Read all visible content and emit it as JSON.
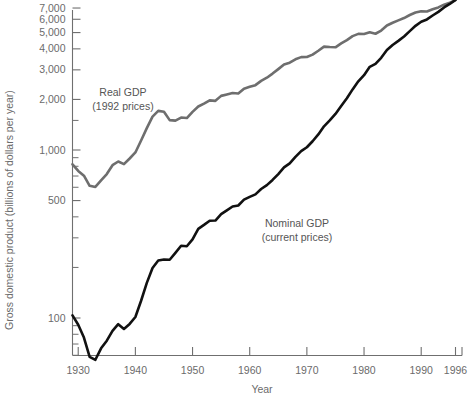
{
  "chart_data": {
    "type": "line",
    "title": "",
    "xlabel": "Year",
    "ylabel": "Gross domestic product (billions of dollars per year)",
    "yscale": "log",
    "ylim": [
      40,
      8000
    ],
    "xlim": [
      1929,
      1996
    ],
    "grid": false,
    "legend": "inline-annotations",
    "y_tick_labels": [
      "100",
      "500",
      "1,000",
      "2,000",
      "3,000",
      "4,000",
      "5,000",
      "6,000",
      "7,000"
    ],
    "y_tick_values": [
      100,
      500,
      1000,
      2000,
      3000,
      4000,
      5000,
      6000,
      7000
    ],
    "y_minor_ticks": [
      50,
      60,
      70,
      80,
      90,
      200,
      300,
      400,
      600,
      700,
      800,
      900,
      1500
    ],
    "x_tick_labels": [
      "1930",
      "1940",
      "1950",
      "1960",
      "1970",
      "1980",
      "1990",
      "1996"
    ],
    "x_tick_values": [
      1930,
      1940,
      1950,
      1960,
      1970,
      1980,
      1990,
      1996
    ],
    "annotations": [
      {
        "name": "real-gdp-label",
        "line1": "Real GDP",
        "line2": "(1992 prices)",
        "x": 123,
        "y": 96
      },
      {
        "name": "nominal-gdp-label",
        "line1": "Nominal GDP",
        "line2": "(current prices)",
        "x": 240,
        "y": 227
      }
    ],
    "colors": {
      "real": "#6e6e6e",
      "nominal": "#111111",
      "axis": "#6f6f6f",
      "text": "#6b6b6b"
    },
    "series": [
      {
        "name": "Real GDP",
        "sublabel": "(1992 prices)",
        "color": "#6e6e6e",
        "x": [
          1929,
          1930,
          1931,
          1932,
          1933,
          1934,
          1935,
          1936,
          1937,
          1938,
          1939,
          1940,
          1941,
          1942,
          1943,
          1944,
          1945,
          1946,
          1947,
          1948,
          1949,
          1950,
          1951,
          1952,
          1953,
          1954,
          1955,
          1956,
          1957,
          1958,
          1959,
          1960,
          1961,
          1962,
          1963,
          1964,
          1965,
          1966,
          1967,
          1968,
          1969,
          1970,
          1971,
          1972,
          1973,
          1974,
          1975,
          1976,
          1977,
          1978,
          1979,
          1980,
          1981,
          1982,
          1983,
          1984,
          1985,
          1986,
          1987,
          1988,
          1989,
          1990,
          1991,
          1992,
          1993,
          1994,
          1995,
          1996
        ],
        "values": [
          822,
          751,
          703,
          612,
          603,
          660,
          719,
          812,
          854,
          824,
          890,
          967,
          1139,
          1350,
          1580,
          1710,
          1690,
          1506,
          1495,
          1560,
          1550,
          1687,
          1815,
          1887,
          1975,
          1962,
          2100,
          2143,
          2185,
          2168,
          2318,
          2377,
          2433,
          2580,
          2694,
          2850,
          3030,
          3226,
          3310,
          3466,
          3572,
          3578,
          3697,
          3898,
          4123,
          4100,
          4085,
          4310,
          4510,
          4760,
          4910,
          4900,
          5020,
          4920,
          5140,
          5510,
          5720,
          5910,
          6100,
          6360,
          6580,
          6700,
          6680,
          6880,
          7060,
          7330,
          7530,
          7800
        ]
      },
      {
        "name": "Nominal GDP",
        "sublabel": "(current prices)",
        "color": "#111111",
        "x": [
          1929,
          1930,
          1931,
          1932,
          1933,
          1934,
          1935,
          1936,
          1937,
          1938,
          1939,
          1940,
          1941,
          1942,
          1943,
          1944,
          1945,
          1946,
          1947,
          1948,
          1949,
          1950,
          1951,
          1952,
          1953,
          1954,
          1955,
          1956,
          1957,
          1958,
          1959,
          1960,
          1961,
          1962,
          1963,
          1964,
          1965,
          1966,
          1967,
          1968,
          1969,
          1970,
          1971,
          1972,
          1973,
          1974,
          1975,
          1976,
          1977,
          1978,
          1979,
          1980,
          1981,
          1982,
          1983,
          1984,
          1985,
          1986,
          1987,
          1988,
          1989,
          1990,
          1991,
          1992,
          1993,
          1994,
          1995,
          1996
        ],
        "values": [
          103.6,
          91.2,
          76.5,
          58.7,
          56.4,
          66.0,
          73.3,
          83.8,
          91.9,
          86.1,
          92.2,
          101.4,
          126.7,
          161.9,
          198.6,
          219.8,
          223.1,
          222.3,
          244.2,
          269.2,
          267.3,
          293.8,
          339.3,
          358.3,
          379.4,
          380.4,
          414.8,
          437.5,
          461.1,
          467.2,
          506.6,
          526.4,
          544.7,
          585.6,
          617.7,
          663.6,
          719.1,
          787.8,
          832.6,
          910.0,
          984.6,
          1038.5,
          1127.1,
          1238.3,
          1382.7,
          1500.0,
          1638.3,
          1825.3,
          2030.9,
          2294.7,
          2563.3,
          2789.5,
          3128.4,
          3255.0,
          3536.7,
          3933.2,
          4220.3,
          4462.8,
          4739.5,
          5103.8,
          5484.4,
          5803.2,
          5986.2,
          6318.9,
          6642.3,
          7054.3,
          7400.5,
          7813.2
        ]
      }
    ]
  }
}
